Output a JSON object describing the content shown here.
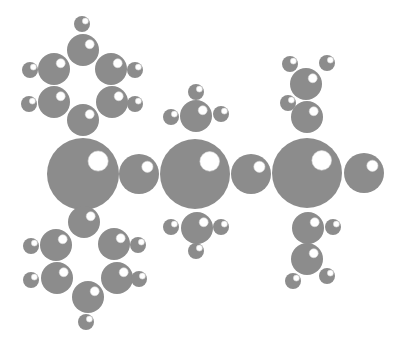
{
  "diagram": {
    "type": "ball-molecular-model",
    "colors": {
      "background": "#ffffff",
      "atom_fill": "#8c8c8c",
      "highlight": "#ffffff"
    },
    "groups": [
      {
        "name": "phenyl-top-left",
        "atoms": [
          {
            "kind": "C",
            "x": 83,
            "y": 50,
            "r": 16
          },
          {
            "kind": "C",
            "x": 54,
            "y": 69,
            "r": 16
          },
          {
            "kind": "C",
            "x": 111,
            "y": 69,
            "r": 16
          },
          {
            "kind": "C",
            "x": 54,
            "y": 102,
            "r": 16
          },
          {
            "kind": "C",
            "x": 112,
            "y": 102,
            "r": 16
          },
          {
            "kind": "C",
            "x": 83,
            "y": 120,
            "r": 16
          },
          {
            "kind": "H",
            "x": 82,
            "y": 24,
            "r": 8
          },
          {
            "kind": "H",
            "x": 30,
            "y": 70,
            "r": 8
          },
          {
            "kind": "H",
            "x": 135,
            "y": 70,
            "r": 8
          },
          {
            "kind": "H",
            "x": 29,
            "y": 104,
            "r": 8
          },
          {
            "kind": "H",
            "x": 135,
            "y": 104,
            "r": 8
          }
        ]
      },
      {
        "name": "central-chain",
        "atoms": [
          {
            "kind": "X",
            "x": 83,
            "y": 174,
            "r": 36
          },
          {
            "kind": "L",
            "x": 139,
            "y": 174,
            "r": 20
          },
          {
            "kind": "X",
            "x": 195,
            "y": 174,
            "r": 35
          },
          {
            "kind": "L",
            "x": 251,
            "y": 174,
            "r": 20
          },
          {
            "kind": "X",
            "x": 307,
            "y": 173,
            "r": 35
          },
          {
            "kind": "L",
            "x": 364,
            "y": 173,
            "r": 20
          }
        ]
      },
      {
        "name": "methyl-top-middle",
        "atoms": [
          {
            "kind": "C",
            "x": 196,
            "y": 116,
            "r": 16
          },
          {
            "kind": "H",
            "x": 196,
            "y": 92,
            "r": 8
          },
          {
            "kind": "H",
            "x": 171,
            "y": 117,
            "r": 8
          },
          {
            "kind": "H",
            "x": 221,
            "y": 114,
            "r": 8
          }
        ]
      },
      {
        "name": "methyl-bottom-middle",
        "atoms": [
          {
            "kind": "C",
            "x": 197,
            "y": 228,
            "r": 16
          },
          {
            "kind": "H",
            "x": 171,
            "y": 227,
            "r": 8
          },
          {
            "kind": "H",
            "x": 221,
            "y": 227,
            "r": 8
          },
          {
            "kind": "H",
            "x": 196,
            "y": 251,
            "r": 8
          }
        ]
      },
      {
        "name": "ethyl-top-right",
        "atoms": [
          {
            "kind": "C",
            "x": 307,
            "y": 117,
            "r": 16
          },
          {
            "kind": "C",
            "x": 306,
            "y": 84,
            "r": 16
          },
          {
            "kind": "H",
            "x": 290,
            "y": 64,
            "r": 8
          },
          {
            "kind": "H",
            "x": 327,
            "y": 63,
            "r": 8
          },
          {
            "kind": "H",
            "x": 288,
            "y": 103,
            "r": 8
          }
        ]
      },
      {
        "name": "ethyl-bottom-right",
        "atoms": [
          {
            "kind": "C",
            "x": 308,
            "y": 228,
            "r": 16
          },
          {
            "kind": "C",
            "x": 307,
            "y": 259,
            "r": 16
          },
          {
            "kind": "H",
            "x": 333,
            "y": 227,
            "r": 8
          },
          {
            "kind": "H",
            "x": 293,
            "y": 281,
            "r": 8
          },
          {
            "kind": "H",
            "x": 327,
            "y": 276,
            "r": 8
          }
        ]
      },
      {
        "name": "phenyl-bottom-left",
        "atoms": [
          {
            "kind": "C",
            "x": 84,
            "y": 222,
            "r": 16
          },
          {
            "kind": "C",
            "x": 56,
            "y": 245,
            "r": 16
          },
          {
            "kind": "C",
            "x": 114,
            "y": 244,
            "r": 16
          },
          {
            "kind": "C",
            "x": 57,
            "y": 278,
            "r": 16
          },
          {
            "kind": "C",
            "x": 117,
            "y": 278,
            "r": 16
          },
          {
            "kind": "C",
            "x": 88,
            "y": 297,
            "r": 16
          },
          {
            "kind": "H",
            "x": 31,
            "y": 246,
            "r": 8
          },
          {
            "kind": "H",
            "x": 138,
            "y": 245,
            "r": 8
          },
          {
            "kind": "H",
            "x": 31,
            "y": 280,
            "r": 8
          },
          {
            "kind": "H",
            "x": 139,
            "y": 279,
            "r": 8
          },
          {
            "kind": "H",
            "x": 86,
            "y": 322,
            "r": 8
          }
        ]
      }
    ]
  }
}
